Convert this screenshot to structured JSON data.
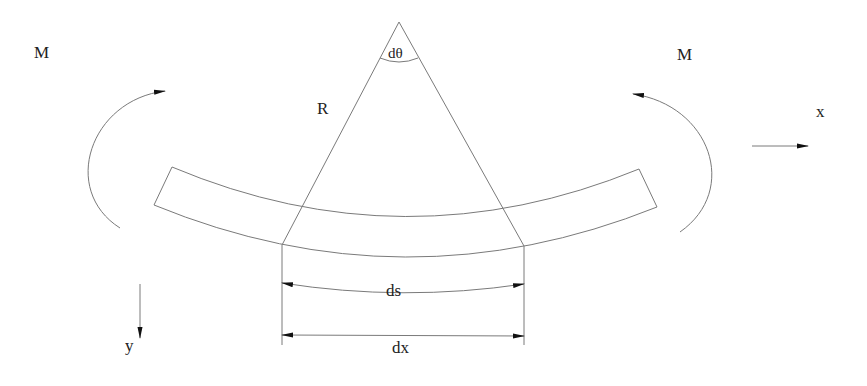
{
  "diagram": {
    "labels": {
      "moment_left": "M",
      "moment_right": "M",
      "radius": "R",
      "angle": "dθ",
      "x_axis": "x",
      "y_axis": "y",
      "arc_length": "ds",
      "chord_length": "dx"
    },
    "colors": {
      "line": "#7a7a7a",
      "text": "#222222",
      "arrowhead": "#111111",
      "background": "#ffffff"
    }
  }
}
